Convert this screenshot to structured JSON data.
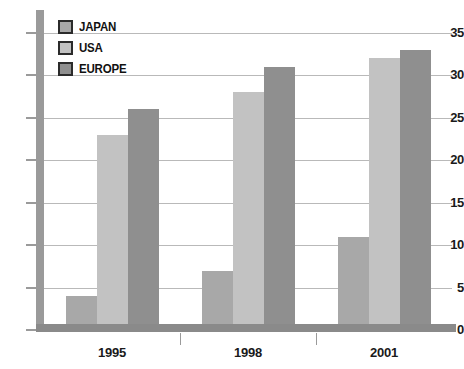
{
  "chart_data": {
    "type": "bar",
    "title": "",
    "subtitle": "",
    "xlabel": "",
    "ylabel": "",
    "categories": [
      "1995",
      "1998",
      "2001"
    ],
    "series": [
      {
        "name": "JAPAN",
        "values": [
          4,
          7,
          11
        ],
        "color": "#a8a8a8"
      },
      {
        "name": "USA",
        "values": [
          23,
          28,
          32
        ],
        "color": "#c2c2c2"
      },
      {
        "name": "EUROPE",
        "values": [
          26,
          31,
          33
        ],
        "color": "#8f8f8f"
      }
    ],
    "ylim": [
      0,
      35
    ],
    "yticks": [
      0,
      5,
      10,
      15,
      20,
      25,
      30,
      35
    ],
    "ytick_labels": [
      "0",
      "5",
      "10",
      "15",
      "20",
      "25",
      "30",
      "35"
    ],
    "grid": true,
    "grid_axis": "y",
    "legend_position": "top-left",
    "annotations": []
  },
  "axes": {
    "y": {
      "ticks": [
        {
          "value": 35,
          "label": "35"
        },
        {
          "value": 30,
          "label": "30"
        },
        {
          "value": 25,
          "label": "25"
        },
        {
          "value": 20,
          "label": "20"
        },
        {
          "value": 15,
          "label": "15"
        },
        {
          "value": 10,
          "label": "10"
        },
        {
          "value": 5,
          "label": "5"
        },
        {
          "value": 0,
          "label": "0"
        }
      ]
    },
    "x": {
      "ticks": [
        {
          "label": "1995"
        },
        {
          "label": "1998"
        },
        {
          "label": "2001"
        }
      ]
    }
  },
  "legend": {
    "items": [
      {
        "label": "JAPAN",
        "color": "#a8a8a8"
      },
      {
        "label": "USA",
        "color": "#c2c2c2"
      },
      {
        "label": "EUROPE",
        "color": "#8f8f8f"
      }
    ]
  },
  "colors": {
    "japan": "#a8a8a8",
    "usa": "#c2c2c2",
    "europe": "#8f8f8f",
    "axis": "#9a9a9a",
    "baseline": "#8a8a8a",
    "gridline": "#b9b9b9",
    "text": "#111111",
    "background": "#ffffff"
  }
}
